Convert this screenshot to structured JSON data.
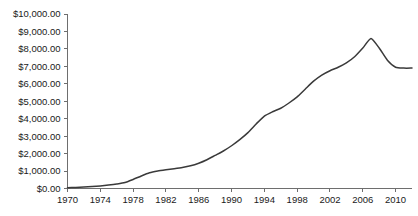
{
  "chart_data": {
    "type": "line",
    "title": "",
    "subtitle": "",
    "xlabel": "",
    "ylabel": "",
    "grid": false,
    "legend": false,
    "legend_position": "none",
    "line_color": "#3a3a3a",
    "axis_color": "#6e6e6e",
    "background_color": "#ffffff",
    "xlim": [
      1970,
      2012
    ],
    "ylim": [
      0,
      10000
    ],
    "y_tick_values": [
      0,
      1000,
      2000,
      3000,
      4000,
      5000,
      6000,
      7000,
      8000,
      9000,
      10000
    ],
    "y_tick_labels": [
      "$0.00",
      "$1,000.00",
      "$2,000.00",
      "$3,000.00",
      "$4,000.00",
      "$5,000.00",
      "$6,000.00",
      "$7,000.00",
      "$8,000.00",
      "$9,000.00",
      "$10,000.00"
    ],
    "x_tick_values": [
      1970,
      1974,
      1978,
      1982,
      1986,
      1990,
      1994,
      1998,
      2002,
      2006,
      2010
    ],
    "x_tick_labels": [
      "1970",
      "1974",
      "1978",
      "1982",
      "1986",
      "1990",
      "1994",
      "1998",
      "2002",
      "2006",
      "2010"
    ],
    "series": [
      {
        "name": "value",
        "x": [
          1970,
          1971,
          1972,
          1973,
          1974,
          1975,
          1976,
          1977,
          1978,
          1979,
          1980,
          1981,
          1982,
          1983,
          1984,
          1985,
          1986,
          1987,
          1988,
          1989,
          1990,
          1991,
          1992,
          1993,
          1994,
          1995,
          1996,
          1997,
          1998,
          1999,
          2000,
          2001,
          2002,
          2003,
          2004,
          2005,
          2006,
          2007,
          2008,
          2009,
          2010,
          2011,
          2012
        ],
        "values": [
          40,
          60,
          80,
          110,
          150,
          200,
          260,
          340,
          520,
          720,
          900,
          1000,
          1070,
          1130,
          1200,
          1300,
          1450,
          1650,
          1900,
          2150,
          2450,
          2800,
          3200,
          3700,
          4150,
          4400,
          4600,
          4900,
          5250,
          5700,
          6150,
          6500,
          6750,
          6950,
          7200,
          7550,
          8050,
          8600,
          8050,
          7350,
          6950,
          6900,
          6900
        ]
      }
    ]
  }
}
